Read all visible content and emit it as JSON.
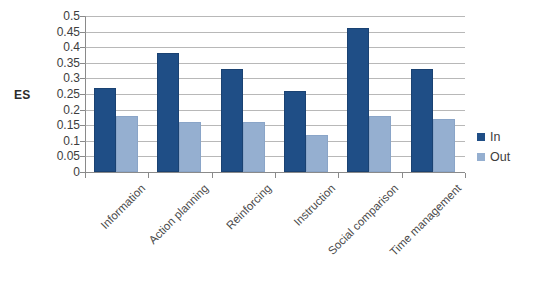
{
  "chart_data": {
    "type": "bar",
    "title": "",
    "subtitle": "",
    "xlabel": "",
    "ylabel": "ES",
    "ylim": [
      0,
      0.5
    ],
    "ytick_step": 0.05,
    "yticks": [
      "0.5",
      "0.45",
      "0.4",
      "0.35",
      "0.3",
      "0.25",
      "0.2",
      "0.15",
      "0.1",
      "0.05",
      "0"
    ],
    "ytick_values": [
      0.5,
      0.45,
      0.4,
      0.35,
      0.3,
      0.25,
      0.2,
      0.15,
      0.1,
      0.05,
      0
    ],
    "grid": true,
    "grid_axis": "y",
    "legend_position": "right",
    "categories": [
      "Information",
      "Action planning",
      "Reinforcing",
      "Instruction",
      "Social comparison",
      "Time management"
    ],
    "series": [
      {
        "name": "In",
        "color": "#1f4e86",
        "values": [
          0.27,
          0.38,
          0.33,
          0.26,
          0.46,
          0.33
        ]
      },
      {
        "name": "Out",
        "color": "#95afd0",
        "values": [
          0.18,
          0.16,
          0.16,
          0.12,
          0.18,
          0.17
        ]
      }
    ]
  },
  "legend": {
    "items": [
      {
        "label": "In",
        "color": "#1f4e86"
      },
      {
        "label": "Out",
        "color": "#95afd0"
      }
    ]
  },
  "colors": {
    "series_in": "#1f4e86",
    "series_out": "#95afd0",
    "gridline": "#9c9c9c",
    "axis": "#8a8a8a",
    "text": "#3d3d3d",
    "background": "#ffffff"
  }
}
